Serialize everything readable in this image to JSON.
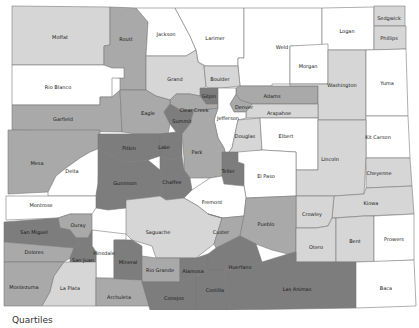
{
  "map": {
    "title": "Colorado counties by quartile",
    "legend": {
      "title": "Quartiles"
    },
    "quartile_colors": {
      "q1": "#ffffff",
      "q2": "#d6d6d6",
      "q3": "#a9a9a9",
      "q4": "#7d7d7d"
    },
    "counties": [
      {
        "name": "Moffat",
        "q": "q2"
      },
      {
        "name": "Routt",
        "q": "q3"
      },
      {
        "name": "Jackson",
        "q": "q1"
      },
      {
        "name": "Larimer",
        "q": "q1"
      },
      {
        "name": "Weld",
        "q": "q1"
      },
      {
        "name": "Logan",
        "q": "q1"
      },
      {
        "name": "Sedgwick",
        "q": "q2"
      },
      {
        "name": "Phillips",
        "q": "q2"
      },
      {
        "name": "Morgan",
        "q": "q1"
      },
      {
        "name": "Rio Blanco",
        "q": "q1"
      },
      {
        "name": "Grand",
        "q": "q2"
      },
      {
        "name": "Boulder",
        "q": "q2"
      },
      {
        "name": "Gilpin",
        "q": "q4"
      },
      {
        "name": "Clear Creek",
        "q": "q3"
      },
      {
        "name": "Adams",
        "q": "q3"
      },
      {
        "name": "Washington",
        "q": "q2"
      },
      {
        "name": "Yuma",
        "q": "q1"
      },
      {
        "name": "Denver",
        "q": "q3"
      },
      {
        "name": "Arapahoe",
        "q": "q2"
      },
      {
        "name": "Garfield",
        "q": "q3"
      },
      {
        "name": "Eagle",
        "q": "q3"
      },
      {
        "name": "Summit",
        "q": "q4"
      },
      {
        "name": "Jefferson",
        "q": "q1"
      },
      {
        "name": "Douglas",
        "q": "q2"
      },
      {
        "name": "Elbert",
        "q": "q1"
      },
      {
        "name": "Kit Carson",
        "q": "q1"
      },
      {
        "name": "Mesa",
        "q": "q3"
      },
      {
        "name": "Delta",
        "q": "q1"
      },
      {
        "name": "Pitkin",
        "q": "q4"
      },
      {
        "name": "Lake",
        "q": "q4"
      },
      {
        "name": "Park",
        "q": "q3"
      },
      {
        "name": "Lincoln",
        "q": "q2"
      },
      {
        "name": "Gunnison",
        "q": "q4"
      },
      {
        "name": "Chaffee",
        "q": "q4"
      },
      {
        "name": "Teller",
        "q": "q4"
      },
      {
        "name": "El Paso",
        "q": "q1"
      },
      {
        "name": "Cheyenne",
        "q": "q2"
      },
      {
        "name": "Montrose",
        "q": "q1"
      },
      {
        "name": "Fremont",
        "q": "q1"
      },
      {
        "name": "Kiowa",
        "q": "q2"
      },
      {
        "name": "Crowley",
        "q": "q2"
      },
      {
        "name": "Ouray",
        "q": "q3"
      },
      {
        "name": "Saguache",
        "q": "q2"
      },
      {
        "name": "Custer",
        "q": "q3"
      },
      {
        "name": "Pueblo",
        "q": "q3"
      },
      {
        "name": "San Miguel",
        "q": "q4"
      },
      {
        "name": "Hinsdale",
        "q": "q1"
      },
      {
        "name": "Otero",
        "q": "q2"
      },
      {
        "name": "Bent",
        "q": "q2"
      },
      {
        "name": "Prowers",
        "q": "q1"
      },
      {
        "name": "Dolores",
        "q": "q3"
      },
      {
        "name": "San Juan",
        "q": "q4"
      },
      {
        "name": "Mineral",
        "q": "q4"
      },
      {
        "name": "Rio Grande",
        "q": "q3"
      },
      {
        "name": "Alamosa",
        "q": "q4"
      },
      {
        "name": "Huerfano",
        "q": "q4"
      },
      {
        "name": "Montezuma",
        "q": "q3"
      },
      {
        "name": "La Plata",
        "q": "q2"
      },
      {
        "name": "Archuleta",
        "q": "q3"
      },
      {
        "name": "Conejos",
        "q": "q4"
      },
      {
        "name": "Costilla",
        "q": "q4"
      },
      {
        "name": "Las Animas",
        "q": "q4"
      },
      {
        "name": "Baca",
        "q": "q1"
      }
    ]
  }
}
